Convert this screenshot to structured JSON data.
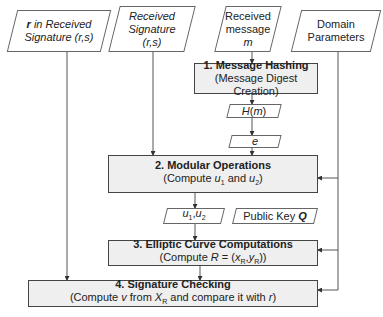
{
  "inputs": [
    {
      "id": "r-sig",
      "line1": "r in Received",
      "line2": "Signature (r,s)"
    },
    {
      "id": "sig",
      "line1": "Received",
      "line2": "Signature",
      "line3": "(r,s)"
    },
    {
      "id": "msg",
      "line1": "Received",
      "line2": "message",
      "line3": "m"
    },
    {
      "id": "domain",
      "line1": "Domain",
      "line2": "Parameters"
    }
  ],
  "steps": [
    {
      "title": "1. Message Hashing",
      "sub": "(Message Digest Creation)"
    },
    {
      "title": "2. Modular Operations",
      "sub": "(Compute u1 and u2)"
    },
    {
      "title": "3. Elliptic Curve Computations",
      "sub": "(Compute R = (xR,yR))"
    },
    {
      "title": "4. Signature Checking",
      "sub": "(Compute v from XR and compare it with r)"
    }
  ],
  "data_nodes": {
    "hm": "H(m)",
    "e": "e",
    "u": "u1,u2",
    "pubkey": "Public Key Q"
  },
  "colors": {
    "box_fill": "#efefef",
    "border": "#444444",
    "line": "#555555"
  }
}
